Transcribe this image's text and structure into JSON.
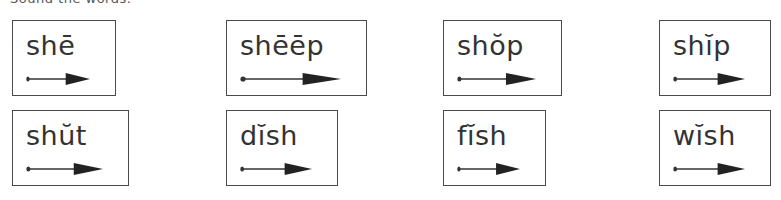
{
  "header": {
    "text": "Sound the words."
  },
  "cards": [
    {
      "word": "shē",
      "vowel_mark": "macron",
      "x": 12,
      "y": 20,
      "w": 104,
      "h": 76
    },
    {
      "word": "shēēp",
      "vowel_mark": "macron",
      "x": 226,
      "y": 20,
      "w": 141,
      "h": 76
    },
    {
      "word": "shŏp",
      "vowel_mark": "breve",
      "x": 443,
      "y": 20,
      "w": 119,
      "h": 76
    },
    {
      "word": "shĭp",
      "vowel_mark": "breve",
      "x": 659,
      "y": 20,
      "w": 112,
      "h": 76
    },
    {
      "word": "shŭt",
      "vowel_mark": "breve",
      "x": 12,
      "y": 110,
      "w": 117,
      "h": 76
    },
    {
      "word": "dĭsh",
      "vowel_mark": "breve",
      "x": 226,
      "y": 110,
      "w": 112,
      "h": 76
    },
    {
      "word": "fĭsh",
      "vowel_mark": "breve",
      "x": 443,
      "y": 110,
      "w": 103,
      "h": 76
    },
    {
      "word": "wĭsh",
      "vowel_mark": "breve",
      "x": 659,
      "y": 110,
      "w": 112,
      "h": 76
    }
  ],
  "icons": {
    "arrow": "dot-to-arrow-icon"
  },
  "colors": {
    "ink": "#333333",
    "border": "#4a4a4a",
    "background": "#ffffff"
  }
}
